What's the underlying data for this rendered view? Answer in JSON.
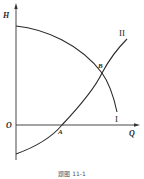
{
  "diagram": {
    "axes": {
      "y_label": "H",
      "x_label": "Q",
      "origin_label": "O"
    },
    "curves": [
      {
        "id": "I",
        "label": "I",
        "description": "descending curve"
      },
      {
        "id": "II",
        "label": "II",
        "description": "ascending curve"
      }
    ],
    "points": [
      {
        "label": "A",
        "description": "curve II crosses Q axis"
      },
      {
        "label": "B",
        "description": "intersection of curves I and II"
      }
    ],
    "caption": "题图 11-1"
  }
}
